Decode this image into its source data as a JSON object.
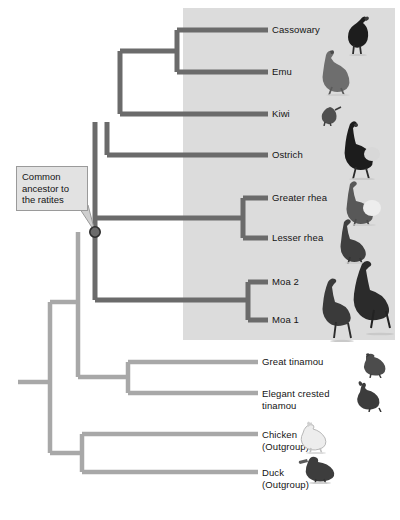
{
  "figure": {
    "type": "phylogenetic-tree",
    "highlight_panel": {
      "name": "ratite-clade-highlight",
      "x": 183,
      "y": 8,
      "width": 212,
      "height": 332,
      "color": "#dcdcdc"
    }
  },
  "colors": {
    "ratite_branch": "#6b6b6b",
    "other_branch": "#a8a8a8",
    "node_fill": "#6b6b6b",
    "node_stroke": "#2e2e2e",
    "callout_bg": "#e2e2e2",
    "callout_border": "#9a9a9a",
    "text": "#141414",
    "panel": "#dcdcdc"
  },
  "annotation": {
    "name": "common-ancestor-callout",
    "text": "Common ancestor to the ratites",
    "points_to_node": "ratite-ancestor-node"
  },
  "taxa": [
    {
      "id": "cassowary",
      "label": "Cassowary",
      "y": 30,
      "group": "ratite",
      "icon": "cassowary-icon"
    },
    {
      "id": "emu",
      "label": "Emu",
      "y": 72,
      "group": "ratite",
      "icon": "emu-icon"
    },
    {
      "id": "kiwi",
      "label": "Kiwi",
      "y": 114,
      "group": "ratite",
      "icon": "kiwi-icon"
    },
    {
      "id": "ostrich",
      "label": "Ostrich",
      "y": 155,
      "group": "ratite",
      "icon": "ostrich-icon"
    },
    {
      "id": "greater-rhea",
      "label": "Greater rhea",
      "y": 198,
      "group": "ratite",
      "icon": "greater-rhea-icon"
    },
    {
      "id": "lesser-rhea",
      "label": "Lesser rhea",
      "y": 238,
      "group": "ratite",
      "icon": "lesser-rhea-icon"
    },
    {
      "id": "moa-2",
      "label": "Moa 2",
      "y": 282,
      "group": "ratite",
      "icon": "moa-icon"
    },
    {
      "id": "moa-1",
      "label": "Moa 1",
      "y": 320,
      "group": "ratite",
      "icon": "moa-icon"
    },
    {
      "id": "great-tinamou",
      "label": "Great tinamou",
      "y": 362,
      "group": "tinamou",
      "icon": "great-tinamou-icon"
    },
    {
      "id": "elegant-crested-tinamou",
      "label": "Elegant crested\ntinamou",
      "y": 393,
      "group": "tinamou",
      "icon": "elegant-crested-tinamou-icon"
    },
    {
      "id": "chicken",
      "label": "Chicken\n(Outgroup)",
      "y": 434,
      "group": "outgroup",
      "icon": "chicken-icon"
    },
    {
      "id": "duck",
      "label": "Duck\n(Outgroup)",
      "y": 472,
      "group": "outgroup",
      "icon": "duck-icon"
    }
  ],
  "nodes": [
    {
      "id": "cassowary-emu-node",
      "x": 177,
      "group": "ratite"
    },
    {
      "id": "cassowary-emu-kiwi-node",
      "x": 120,
      "group": "ratite"
    },
    {
      "id": "ostrich-node",
      "x": 107,
      "group": "ratite"
    },
    {
      "id": "rhea-node",
      "x": 243,
      "group": "ratite"
    },
    {
      "id": "moa-node",
      "x": 248,
      "group": "ratite"
    },
    {
      "id": "ratite-ancestor-node",
      "x": 95,
      "y": 232,
      "group": "ratite",
      "marked": true
    },
    {
      "id": "tinamou-node",
      "x": 128,
      "group": "tinamou"
    },
    {
      "id": "palaeognath-node",
      "x": 78,
      "group": "tinamou"
    },
    {
      "id": "outgroup-node",
      "x": 82,
      "group": "outgroup"
    },
    {
      "id": "root-node",
      "x": 50,
      "group": "root"
    }
  ]
}
